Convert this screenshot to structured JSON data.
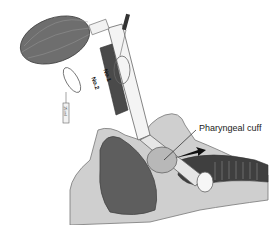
{
  "figure": {
    "type": "medical-illustration"
  },
  "labels": {
    "pharyngeal_cuff": "Pharyngeal cuff",
    "lumen_1": "No.1",
    "lumen_2": "No.2",
    "pilot_volume": "15 ml"
  },
  "colors": {
    "bulb": "#6e6e6e",
    "tube_dark": "#4a4a4a",
    "tissue_dark": "#5e5e5e",
    "tissue_light": "#c8c8c8",
    "outline": "#555555",
    "background": "#ffffff"
  }
}
